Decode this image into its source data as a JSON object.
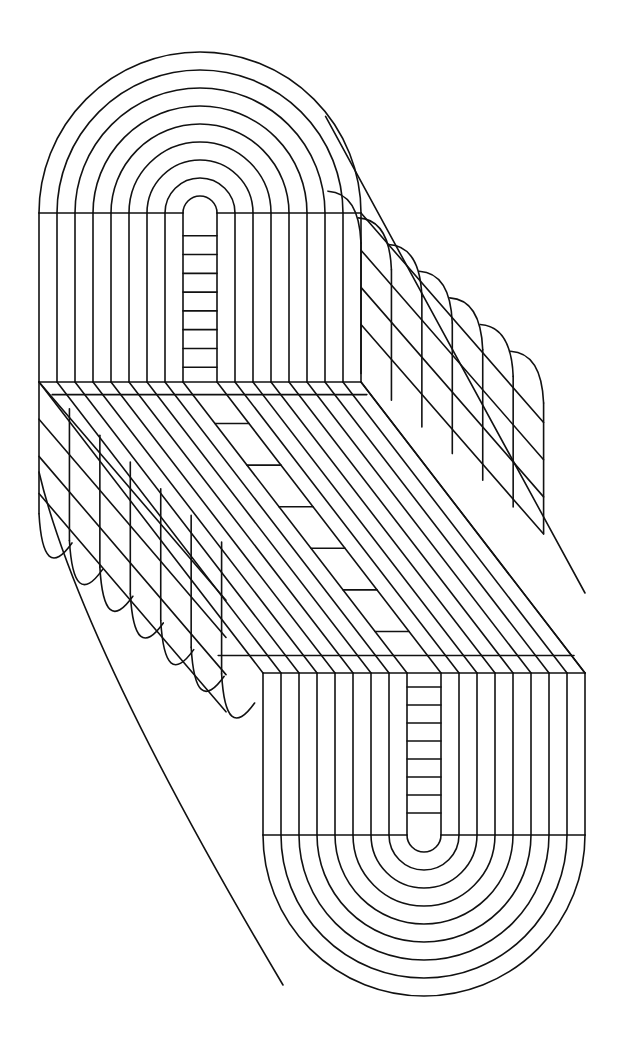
{
  "artwork": {
    "title": "Extruded stadium forms with concentric arcs",
    "description": "Black line op-art drawing of two offset extruded U-shaped blocks joined by diagonal hatching",
    "stroke_color": "#111111",
    "background_color": "#ffffff"
  },
  "geometry": {
    "ring_count": 9,
    "ring_step": 18,
    "inner_radius": 17,
    "depth_vector": [
      220,
      291
    ],
    "depth_steps": 6,
    "top_block": {
      "center_x": 200,
      "face_top": 213,
      "face_bottom": 382,
      "ladder_rungs": 8
    },
    "bottom_block": {
      "center_x": 424,
      "face_top": 673,
      "face_bottom": 835,
      "ladder_rungs": 8
    },
    "middle_ladder_rungs": 6
  }
}
